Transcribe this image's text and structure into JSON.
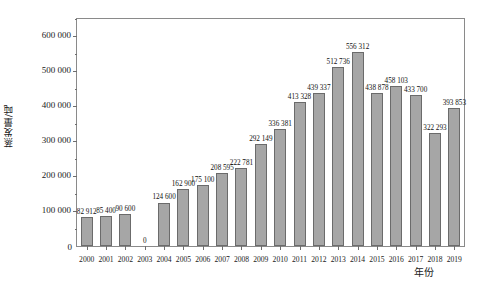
{
  "chart_data": {
    "type": "bar",
    "title": "",
    "xlabel": "年份",
    "ylabel": "蒸发量/吨",
    "categories": [
      "2000",
      "2001",
      "2002",
      "2003",
      "2004",
      "2005",
      "2006",
      "2007",
      "2008",
      "2009",
      "2010",
      "2011",
      "2012",
      "2013",
      "2014",
      "2015",
      "2016",
      "2017",
      "2018",
      "2019"
    ],
    "values": [
      82912,
      85400,
      90600,
      0,
      124600,
      162900,
      175100,
      208595,
      222781,
      292149,
      336381,
      413328,
      439337,
      512736,
      556312,
      438878,
      458103,
      433700,
      322293,
      393853
    ],
    "value_labels": [
      "82 912",
      "85 400",
      "90 600",
      "0",
      "124 600",
      "162 900",
      "175 100",
      "208 595",
      "222 781",
      "292 149",
      "336 381",
      "413 328",
      "439 337",
      "512 736",
      "556 312",
      "438 878",
      "458 103",
      "433 700",
      "322 293",
      "393 853"
    ],
    "ylim": [
      0,
      650000
    ],
    "ytick_values": [
      0,
      100000,
      200000,
      300000,
      400000,
      500000,
      600000
    ],
    "ytick_labels": [
      "0",
      "100 000",
      "200 000",
      "300 000",
      "400 000",
      "500 000",
      "600 000"
    ],
    "yminor_values": [
      50000,
      150000,
      250000,
      350000,
      450000,
      550000,
      650000
    ],
    "grid": false,
    "legend": "none",
    "bar_color": "#a6a6a6",
    "bar_edge_color": "#6b6b6b",
    "axis_color": "#8a8a8a"
  }
}
